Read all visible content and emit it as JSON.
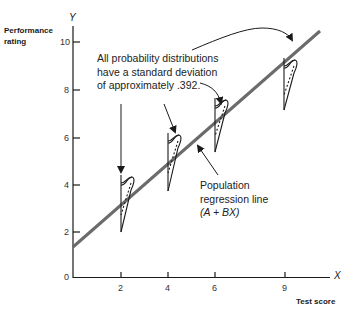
{
  "diagram": {
    "y_axis": {
      "symbol": "Y",
      "title_line1": "Performance",
      "title_line2": "rating",
      "ticks": [
        "0",
        "2",
        "4",
        "6",
        "8",
        "10"
      ]
    },
    "x_axis": {
      "symbol": "X",
      "title": "Test score",
      "ticks": [
        "2",
        "4",
        "6",
        "9"
      ]
    },
    "annotation_sd": {
      "line1": "All probability distributions",
      "line2": "have a standard deviation",
      "line3": "of approximately .392."
    },
    "annotation_line": {
      "line1": "Population",
      "line2": "regression line",
      "line3": "(A + BX)"
    },
    "regression": {
      "intercept_approx": 1.3,
      "slope_approx": 0.88
    },
    "distributions_at_x": [
      2,
      4,
      6,
      9
    ],
    "colors": {
      "line": "#6b6b6b",
      "ink": "#1a1a1a"
    }
  }
}
